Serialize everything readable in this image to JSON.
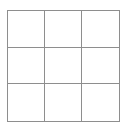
{
  "board": {
    "rows": 3,
    "cols": 3,
    "cells": [
      {
        "value": ""
      },
      {
        "value": ""
      },
      {
        "value": ""
      },
      {
        "value": ""
      },
      {
        "value": ""
      },
      {
        "value": ""
      },
      {
        "value": ""
      },
      {
        "value": ""
      },
      {
        "value": ""
      }
    ]
  },
  "colors": {
    "grid_line": "#8e8e8e",
    "background": "#ffffff"
  }
}
